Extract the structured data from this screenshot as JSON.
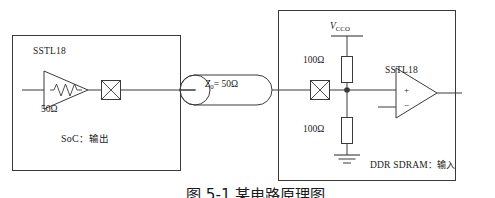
{
  "figure": {
    "type": "schematic-diagram",
    "caption": "图 5-1 某电路原理图",
    "line_color": "#3a3a3a",
    "text_color": "#1a1a1a",
    "background": "#ffffff"
  },
  "blocks": {
    "soc": {
      "name": "SoC block",
      "caption_prefix": "SoC",
      "caption_sep": "：",
      "caption_value": "输出",
      "caption_full": "SoC：输出",
      "driver_label": "SSTL18",
      "series_resistor_label": "50Ω"
    },
    "ddr": {
      "name": "DDR SDRAM block",
      "caption_prefix": "DDR SDRAM",
      "caption_sep": "：",
      "caption_value": "输入",
      "caption_full": "DDR SDRAM：输入",
      "receiver_label": "SSTL18",
      "supply_label_main": "V",
      "supply_label_sub": "CCO",
      "supply_label_full": "VCCO",
      "pullup_resistor_label": "100Ω",
      "pulldown_resistor_label": "100Ω",
      "plus_input": "+",
      "minus_input": "−",
      "ground_label": "GND"
    }
  },
  "transmission_line": {
    "name": "transmission line",
    "impedance_symbol": "Z",
    "impedance_sub": "0",
    "impedance_value": "= 50Ω",
    "impedance_full": "Z0 = 50Ω"
  },
  "symbols": {
    "pad_left": "crossed-box-pad",
    "pad_right": "crossed-box-pad",
    "junction": "junction-dot",
    "ground": "ground-symbol"
  }
}
